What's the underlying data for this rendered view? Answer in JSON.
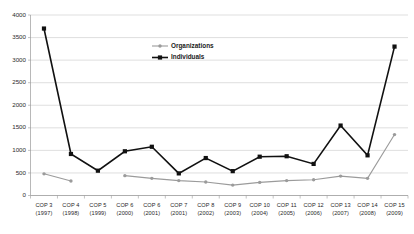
{
  "chart_data": {
    "type": "line",
    "title": "",
    "xlabel": "",
    "ylabel": "",
    "ylim": [
      0,
      4000
    ],
    "ytick_step": 500,
    "yticks": [
      0,
      500,
      1000,
      1500,
      2000,
      2500,
      3000,
      3500,
      4000
    ],
    "grid": true,
    "legend_position": "inside-top-center",
    "categories": [
      "COP 3\n(1997)",
      "COP 4\n(1998)",
      "COP 5\n(1999)",
      "COP 6\n(2000)",
      "COP 6\n(2001)",
      "COP 7\n(2001)",
      "COP 8\n(2002)",
      "COP 9\n(2003)",
      "COP 10\n(2004)",
      "COP 11\n(2005)",
      "COP 12\n(2006)",
      "COP 13\n(2007)",
      "COP 14\n(2008)",
      "COP 15\n(2009)"
    ],
    "category_lines": [
      [
        "COP 3",
        "(1997)"
      ],
      [
        "COP 4",
        "(1998)"
      ],
      [
        "COP 5",
        "(1999)"
      ],
      [
        "COP 6",
        "(2000)"
      ],
      [
        "COP 6",
        "(2001)"
      ],
      [
        "COP 7",
        "(2001)"
      ],
      [
        "COP 8",
        "(2002)"
      ],
      [
        "COP 9",
        "(2003)"
      ],
      [
        "COP 10",
        "(2004)"
      ],
      [
        "COP 11",
        "(2005)"
      ],
      [
        "COP 12",
        "(2006)"
      ],
      [
        "COP 13",
        "(2007)"
      ],
      [
        "COP 14",
        "(2008)"
      ],
      [
        "COP 15",
        "(2009)"
      ]
    ],
    "series": [
      {
        "name": "Organizations",
        "color": "#9b9b9b",
        "marker": "circle",
        "values": [
          480,
          320,
          null,
          440,
          380,
          330,
          300,
          230,
          290,
          330,
          350,
          430,
          380,
          1350
        ]
      },
      {
        "name": "Individuals",
        "color": "#111111",
        "marker": "square",
        "values": [
          3700,
          920,
          550,
          980,
          1080,
          490,
          830,
          540,
          860,
          870,
          700,
          1550,
          890,
          3300
        ]
      }
    ]
  },
  "legend": {
    "items": [
      {
        "label": "Organizations",
        "color": "#9b9b9b",
        "marker": "circle"
      },
      {
        "label": "Individuals",
        "color": "#111111",
        "marker": "square"
      }
    ]
  },
  "axis": {
    "y_labels": [
      "4000",
      "3500",
      "3000",
      "2500",
      "2000",
      "1500",
      "1000",
      "500",
      "0"
    ]
  }
}
